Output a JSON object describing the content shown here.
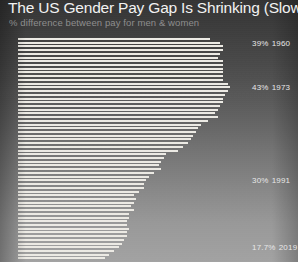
{
  "header": {
    "title": "The US Gender Pay Gap Is Shrinking (Slowly)",
    "subtitle": "% difference between pay for men & women"
  },
  "annotations": [
    {
      "id": "ann-1960",
      "pct": "39%",
      "year": "1960"
    },
    {
      "id": "ann-1973",
      "pct": "43%",
      "year": "1973"
    },
    {
      "id": "ann-1991",
      "pct": "30%",
      "year": "1991"
    },
    {
      "id": "ann-2019",
      "pct": "17.7%",
      "year": "2019"
    }
  ],
  "chart_data": {
    "type": "bar",
    "orientation": "horizontal",
    "title": "The US Gender Pay Gap Is Shrinking (Slowly)",
    "subtitle": "% difference between pay for men & women",
    "xlabel": "% difference between pay for men & women",
    "ylabel": "Year",
    "xlim": [
      0,
      45
    ],
    "grid": false,
    "legend": false,
    "categories": [
      "1960",
      "1961",
      "1962",
      "1963",
      "1964",
      "1965",
      "1966",
      "1967",
      "1968",
      "1969",
      "1970",
      "1971",
      "1972",
      "1973",
      "1974",
      "1975",
      "1976",
      "1977",
      "1978",
      "1979",
      "1980",
      "1981",
      "1982",
      "1983",
      "1984",
      "1985",
      "1986",
      "1987",
      "1988",
      "1989",
      "1990",
      "1991",
      "1992",
      "1993",
      "1994",
      "1995",
      "1996",
      "1997",
      "1998",
      "1999",
      "2000",
      "2001",
      "2002",
      "2003",
      "2004",
      "2005",
      "2006",
      "2007",
      "2008",
      "2009",
      "2010",
      "2011",
      "2012",
      "2013",
      "2014",
      "2015",
      "2016",
      "2017",
      "2018",
      "2019"
    ],
    "values": [
      39.0,
      41.0,
      41.5,
      41.5,
      41.0,
      40.5,
      41.5,
      41.5,
      41.5,
      41.5,
      41.5,
      41.5,
      42.5,
      43.0,
      42.5,
      42.0,
      41.5,
      41.5,
      41.0,
      40.5,
      40.0,
      40.5,
      38.5,
      37.0,
      36.5,
      36.0,
      35.5,
      35.0,
      34.5,
      33.5,
      32.5,
      30.0,
      29.5,
      29.0,
      28.5,
      29.0,
      27.5,
      26.5,
      26.0,
      25.5,
      25.5,
      24.5,
      23.5,
      24.0,
      23.5,
      23.0,
      23.5,
      22.5,
      22.5,
      22.0,
      22.0,
      22.5,
      22.0,
      22.0,
      21.5,
      21.0,
      20.5,
      19.5,
      18.5,
      17.7
    ],
    "annotated_points": [
      {
        "year": "1960",
        "value": 39.0,
        "label": "39% 1960"
      },
      {
        "year": "1973",
        "value": 43.0,
        "label": "43% 1973"
      },
      {
        "year": "1991",
        "value": 30.0,
        "label": "30% 1991"
      },
      {
        "year": "2019",
        "value": 17.7,
        "label": "17.7% 2019"
      }
    ]
  },
  "colors": {
    "bar": "#eceae4",
    "text": "#f2f2f2",
    "subtitle": "#8e8e8e",
    "bg_top": "#343434",
    "bg_bottom": "#a2a2a2"
  }
}
